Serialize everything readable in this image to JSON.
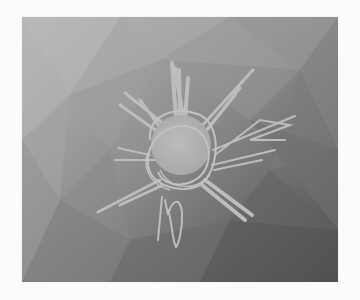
{
  "image": {
    "description": "Grayscale sketch of a spiky scribbled sun/starburst on a low-poly faceted gray gradient background",
    "frame": {
      "x": 22,
      "y": 17,
      "width": 316,
      "height": 265
    },
    "colors": {
      "page_background": "#fbfbfb",
      "gradient_top_left": "#b4b4b4",
      "gradient_bottom_right": "#4e4e4e",
      "sketch_stroke": "#bdbdbd",
      "sketch_fill": "#b2b2b2"
    },
    "subject": {
      "shape": "scribbled circle with radiating spikes",
      "center": {
        "x": 181,
        "y": 145
      },
      "radius": 32,
      "squiggle_below": {
        "x": 170,
        "y": 215
      }
    }
  }
}
